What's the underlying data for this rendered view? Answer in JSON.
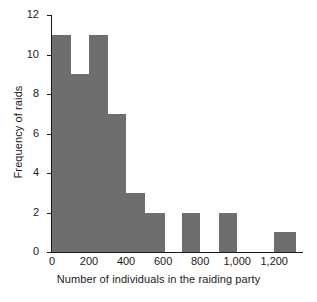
{
  "chart_data": {
    "type": "bar",
    "title": "",
    "xlabel": "Number of individuals in the raiding party",
    "ylabel": "Frequency of raids",
    "xlim": [
      0,
      1350
    ],
    "ylim": [
      0,
      12
    ],
    "xticks": [
      0,
      200,
      400,
      600,
      800,
      1000,
      1200
    ],
    "xtick_labels": [
      "0",
      "200",
      "400",
      "600",
      "800",
      "1,000",
      "1,200"
    ],
    "yticks": [
      0,
      2,
      4,
      6,
      8,
      10,
      12
    ],
    "ytick_labels": [
      "0",
      "2",
      "4",
      "6",
      "8",
      "10",
      "12"
    ],
    "grid": false,
    "legend": false,
    "bin_width": 100,
    "bar_color": "#6e6e6e",
    "bins": [
      {
        "start": 0,
        "end": 100,
        "value": 11
      },
      {
        "start": 100,
        "end": 200,
        "value": 9
      },
      {
        "start": 200,
        "end": 300,
        "value": 11
      },
      {
        "start": 300,
        "end": 400,
        "value": 7
      },
      {
        "start": 400,
        "end": 500,
        "value": 3
      },
      {
        "start": 500,
        "end": 610,
        "value": 2
      },
      {
        "start": 610,
        "end": 700,
        "value": 0
      },
      {
        "start": 700,
        "end": 800,
        "value": 2
      },
      {
        "start": 800,
        "end": 900,
        "value": 0
      },
      {
        "start": 900,
        "end": 1000,
        "value": 2
      },
      {
        "start": 1000,
        "end": 1200,
        "value": 0
      },
      {
        "start": 1200,
        "end": 1320,
        "value": 1
      }
    ],
    "categories": [
      "0-100",
      "100-200",
      "200-300",
      "300-400",
      "400-500",
      "500-610",
      "610-700",
      "700-800",
      "800-900",
      "900-1000",
      "1000-1200",
      "1200-1320"
    ],
    "values": [
      11,
      9,
      11,
      7,
      3,
      2,
      0,
      2,
      0,
      2,
      0,
      1
    ]
  }
}
